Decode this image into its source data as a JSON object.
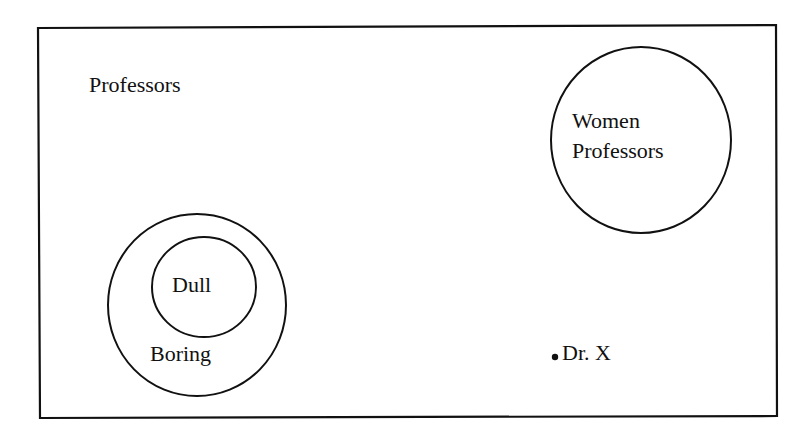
{
  "diagram": {
    "universe_label": "Professors",
    "sets": [
      {
        "id": "women",
        "label_line1": "Women",
        "label_line2": "Professors"
      },
      {
        "id": "boring",
        "label": "Boring"
      },
      {
        "id": "dull",
        "label": "Dull"
      }
    ],
    "point": {
      "label": "Dr. X"
    },
    "colors": {
      "stroke": "#111111",
      "background": "#ffffff"
    }
  }
}
